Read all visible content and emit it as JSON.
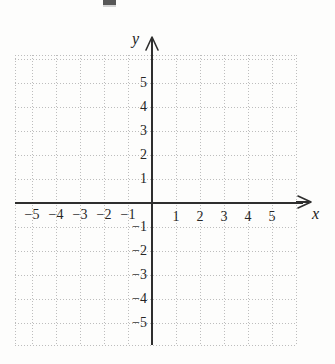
{
  "figure": {
    "kind": "cartesian-coordinate-grid",
    "background_color": "#fdfdfc",
    "grid_color": "#bdbdbd",
    "axis_color": "#2e2e2e",
    "label_color": "#1a1a1a",
    "axis_labels": {
      "x": "x",
      "y": "y"
    },
    "arrows": {
      "x_direction": "right-arrow-icon",
      "y_direction": "up-arrow-icon"
    }
  },
  "chart_data": {
    "type": "scatter",
    "title": "",
    "subtitle": "",
    "xlabel": "x",
    "ylabel": "y",
    "xlim": [
      -6,
      6
    ],
    "ylim": [
      -6,
      6
    ],
    "xticks": [
      -5,
      -4,
      -3,
      -2,
      -1,
      1,
      2,
      3,
      4,
      5
    ],
    "yticks": [
      5,
      4,
      3,
      2,
      1,
      -1,
      -2,
      -3,
      -4,
      -5
    ],
    "xticklabels": [
      "−5",
      "−4",
      "−3",
      "−2",
      "−1",
      "1",
      "2",
      "3",
      "4",
      "5"
    ],
    "yticklabels": [
      "5",
      "4",
      "3",
      "2",
      "1",
      "−1",
      "−2",
      "−3",
      "−4",
      "−5"
    ],
    "grid": true,
    "grid_style": "dotted",
    "grid_spacing_units": 1,
    "legend": null,
    "series": [],
    "x": [],
    "y": [],
    "annotations": []
  },
  "ticks": {
    "y_positive": [
      {
        "label": "5",
        "value": 5
      },
      {
        "label": "4",
        "value": 4
      },
      {
        "label": "3",
        "value": 3
      },
      {
        "label": "2",
        "value": 2
      },
      {
        "label": "1",
        "value": 1
      }
    ],
    "y_negative": [
      {
        "label": "−1",
        "value": -1
      },
      {
        "label": "−2",
        "value": -2
      },
      {
        "label": "−3",
        "value": -3
      },
      {
        "label": "−4",
        "value": -4
      },
      {
        "label": "−5",
        "value": -5
      }
    ],
    "x_negative": [
      {
        "label": "−5",
        "value": -5
      },
      {
        "label": "−4",
        "value": -4
      },
      {
        "label": "−3",
        "value": -3
      },
      {
        "label": "−2",
        "value": -2
      },
      {
        "label": "−1",
        "value": -1
      }
    ],
    "x_positive": [
      {
        "label": "1",
        "value": 1
      },
      {
        "label": "2",
        "value": 2
      },
      {
        "label": "3",
        "value": 3
      },
      {
        "label": "4",
        "value": 4
      },
      {
        "label": "5",
        "value": 5
      }
    ]
  }
}
